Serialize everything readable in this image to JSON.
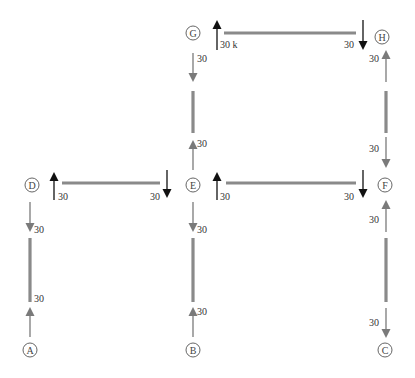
{
  "diagram": {
    "type": "free-body / member force diagram",
    "colors": {
      "member": "#8a8a8a",
      "force_dark": "#111111",
      "force_gray": "#7a7a7a",
      "node_stroke": "#555555",
      "text": "#333333"
    },
    "nodes": [
      {
        "id": "A",
        "label": "A",
        "x": 30,
        "y": 350
      },
      {
        "id": "B",
        "label": "B",
        "x": 193,
        "y": 350
      },
      {
        "id": "C",
        "label": "C",
        "x": 385,
        "y": 350
      },
      {
        "id": "D",
        "label": "D",
        "x": 32,
        "y": 185
      },
      {
        "id": "E",
        "label": "E",
        "x": 193,
        "y": 185
      },
      {
        "id": "F",
        "label": "F",
        "x": 385,
        "y": 185
      },
      {
        "id": "G",
        "label": "G",
        "x": 193,
        "y": 33
      },
      {
        "id": "H",
        "label": "H",
        "x": 382,
        "y": 37
      }
    ],
    "members": [
      {
        "name": "member-AD",
        "x1": 30,
        "y1": 238,
        "x2": 30,
        "y2": 302
      },
      {
        "name": "member-BE",
        "x1": 193,
        "y1": 238,
        "x2": 193,
        "y2": 302
      },
      {
        "name": "member-EG",
        "x1": 193,
        "y1": 91,
        "x2": 193,
        "y2": 133
      },
      {
        "name": "member-FH",
        "x1": 386,
        "y1": 91,
        "x2": 386,
        "y2": 133
      },
      {
        "name": "member-CF",
        "x1": 386,
        "y1": 238,
        "x2": 386,
        "y2": 302
      },
      {
        "name": "member-DE",
        "x1": 62,
        "y1": 183,
        "x2": 160,
        "y2": 183
      },
      {
        "name": "member-EF",
        "x1": 226,
        "y1": 183,
        "x2": 356,
        "y2": 183
      },
      {
        "name": "member-GH",
        "x1": 224,
        "y1": 33,
        "x2": 356,
        "y2": 33
      }
    ],
    "forces": [
      {
        "name": "force-G-up",
        "x": 217,
        "y_from": 50,
        "y_to": 20,
        "color": "dark",
        "label": "30 k",
        "lx": 220,
        "ly": 48
      },
      {
        "name": "force-GH-H-down",
        "x": 363,
        "y_from": 20,
        "y_to": 50,
        "color": "dark",
        "label": "30",
        "lx": 344,
        "ly": 48
      },
      {
        "name": "force-G-below-down",
        "x": 193,
        "y_from": 53,
        "y_to": 82,
        "color": "gray",
        "label": "30",
        "lx": 197,
        "ly": 62
      },
      {
        "name": "force-H-below-up",
        "x": 386,
        "y_from": 82,
        "y_to": 50,
        "color": "gray",
        "label": "30",
        "lx": 369,
        "ly": 62
      },
      {
        "name": "force-E-above-up",
        "x": 193,
        "y_from": 170,
        "y_to": 140,
        "color": "gray",
        "label": "30",
        "lx": 197,
        "ly": 147
      },
      {
        "name": "force-F-above-down",
        "x": 386,
        "y_from": 137,
        "y_to": 168,
        "color": "gray",
        "label": "30",
        "lx": 369,
        "ly": 152
      },
      {
        "name": "force-D-right-up",
        "x": 54,
        "y_from": 200,
        "y_to": 172,
        "color": "dark",
        "label": "30",
        "lx": 58,
        "ly": 200
      },
      {
        "name": "force-E-left-down",
        "x": 167,
        "y_from": 170,
        "y_to": 198,
        "color": "dark",
        "label": "30",
        "lx": 150,
        "ly": 200
      },
      {
        "name": "force-E-right-up",
        "x": 217,
        "y_from": 200,
        "y_to": 172,
        "color": "dark",
        "label": "30",
        "lx": 220,
        "ly": 200
      },
      {
        "name": "force-F-left-down",
        "x": 363,
        "y_from": 170,
        "y_to": 198,
        "color": "dark",
        "label": "30",
        "lx": 344,
        "ly": 200
      },
      {
        "name": "force-D-below-down",
        "x": 30,
        "y_from": 202,
        "y_to": 232,
        "color": "gray",
        "label": "30",
        "lx": 34,
        "ly": 233
      },
      {
        "name": "force-E-below-down",
        "x": 193,
        "y_from": 202,
        "y_to": 232,
        "color": "gray",
        "label": "30",
        "lx": 197,
        "ly": 233
      },
      {
        "name": "force-F-below-up",
        "x": 386,
        "y_from": 232,
        "y_to": 200,
        "color": "gray",
        "label": "30",
        "lx": 369,
        "ly": 223
      },
      {
        "name": "force-A-above-up",
        "x": 30,
        "y_from": 337,
        "y_to": 307,
        "color": "gray",
        "label": "30",
        "lx": 34,
        "ly": 302
      },
      {
        "name": "force-B-above-up",
        "x": 193,
        "y_from": 337,
        "y_to": 307,
        "color": "gray",
        "label": "30",
        "lx": 197,
        "ly": 315
      },
      {
        "name": "force-C-above-down",
        "x": 386,
        "y_from": 308,
        "y_to": 338,
        "color": "gray",
        "label": "30",
        "lx": 369,
        "ly": 326
      }
    ]
  }
}
